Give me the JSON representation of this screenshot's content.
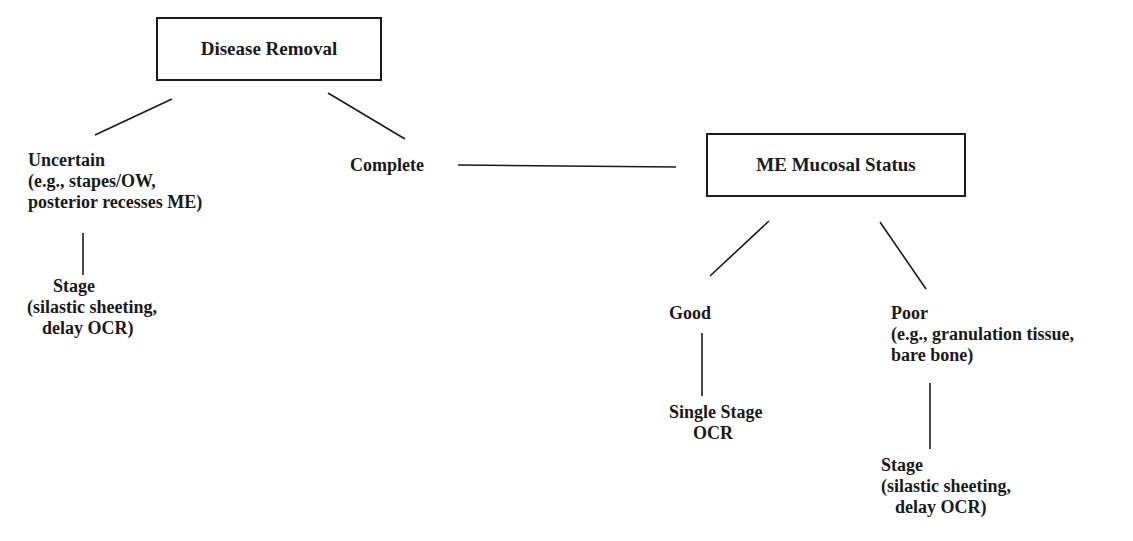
{
  "diagram": {
    "type": "decision-tree",
    "root": {
      "label": "Disease Removal"
    },
    "uncertain": {
      "title": "Uncertain",
      "line2": "(e.g., stapes/OW,",
      "line3": "posterior recesses ME)"
    },
    "complete": {
      "label": "Complete"
    },
    "stage_left": {
      "title": "Stage",
      "line2": "(silastic sheeting,",
      "line3": "delay OCR)"
    },
    "me_status": {
      "label": "ME Mucosal Status"
    },
    "good": {
      "label": "Good"
    },
    "poor": {
      "title": "Poor",
      "line2": "(e.g., granulation tissue,",
      "line3": "bare bone)"
    },
    "single_stage": {
      "line1": "Single Stage",
      "line2": "OCR"
    },
    "stage_right": {
      "title": "Stage",
      "line2": "(silastic sheeting,",
      "line3": "delay OCR)"
    },
    "edges": [
      {
        "from": "Disease Removal",
        "to": "Uncertain"
      },
      {
        "from": "Disease Removal",
        "to": "Complete"
      },
      {
        "from": "Uncertain",
        "to": "Stage"
      },
      {
        "from": "Complete",
        "to": "ME Mucosal Status"
      },
      {
        "from": "ME Mucosal Status",
        "to": "Good"
      },
      {
        "from": "ME Mucosal Status",
        "to": "Poor"
      },
      {
        "from": "Good",
        "to": "Single Stage OCR"
      },
      {
        "from": "Poor",
        "to": "Stage"
      }
    ],
    "colors": {
      "ink": "#1a1a1a",
      "background": "#ffffff"
    }
  }
}
